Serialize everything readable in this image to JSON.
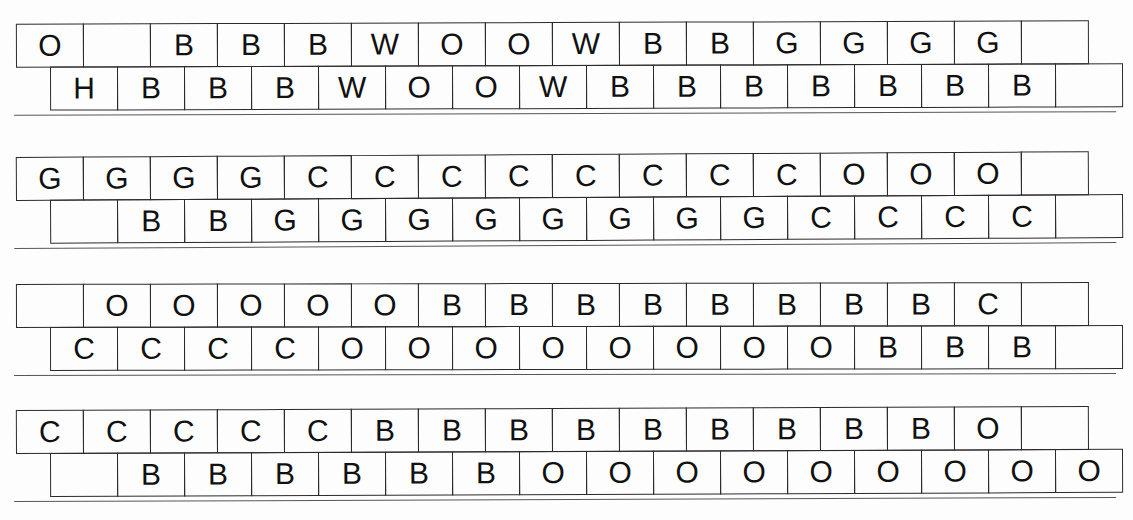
{
  "document": {
    "kind": "two-row letter-coded sequence chart",
    "band_count": 4,
    "row_labels": [
      "top",
      "bottom"
    ],
    "letters_used": [
      "O",
      "H",
      "B",
      "W",
      "G",
      "C"
    ],
    "ink_color": "#111111",
    "rule_color": "#2b2b2b",
    "paper_color": "#fdfdfd"
  },
  "bands": [
    {
      "name": "band-1",
      "top": {
        "offset": 0,
        "cell_width": 68,
        "cells": [
          "O",
          "",
          "B",
          "B",
          "B",
          "W",
          "O",
          "O",
          "W",
          "B",
          "B",
          "G",
          "G",
          "G",
          "G",
          ""
        ]
      },
      "bottom": {
        "offset": 0,
        "cell_width": 68,
        "cells": [
          "H",
          "B",
          "B",
          "B",
          "W",
          "O",
          "O",
          "W",
          "B",
          "B",
          "B",
          "B",
          "B",
          "B",
          "B",
          ""
        ]
      }
    },
    {
      "name": "band-2",
      "top": {
        "offset": 0,
        "cell_width": 68,
        "cells": [
          "G",
          "G",
          "G",
          "G",
          "C",
          "C",
          "C",
          "C",
          "C",
          "C",
          "C",
          "C",
          "O",
          "O",
          "O",
          ""
        ]
      },
      "bottom": {
        "offset": 0,
        "cell_width": 68,
        "cells": [
          "",
          "B",
          "B",
          "G",
          "G",
          "G",
          "G",
          "G",
          "G",
          "G",
          "G",
          "C",
          "C",
          "C",
          "C",
          ""
        ]
      }
    },
    {
      "name": "band-3",
      "top": {
        "offset": 0,
        "cell_width": 68,
        "cells": [
          "",
          "O",
          "O",
          "O",
          "O",
          "O",
          "B",
          "B",
          "B",
          "B",
          "B",
          "B",
          "B",
          "B",
          "C",
          ""
        ]
      },
      "bottom": {
        "offset": 0,
        "cell_width": 68,
        "cells": [
          "C",
          "C",
          "C",
          "C",
          "O",
          "O",
          "O",
          "O",
          "O",
          "O",
          "O",
          "O",
          "B",
          "B",
          "B",
          ""
        ]
      }
    },
    {
      "name": "band-4",
      "top": {
        "offset": 0,
        "cell_width": 68,
        "cells": [
          "C",
          "C",
          "C",
          "C",
          "C",
          "B",
          "B",
          "B",
          "B",
          "B",
          "B",
          "B",
          "B",
          "B",
          "O",
          ""
        ]
      },
      "bottom": {
        "offset": 0,
        "cell_width": 68,
        "cells": [
          "",
          "B",
          "B",
          "B",
          "B",
          "B",
          "B",
          "O",
          "O",
          "O",
          "O",
          "O",
          "O",
          "O",
          "O",
          "O"
        ]
      }
    }
  ]
}
